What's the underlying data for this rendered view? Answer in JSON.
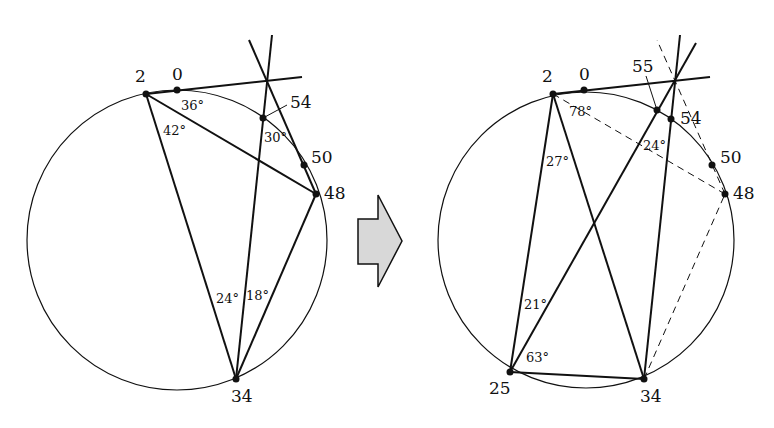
{
  "left_figure": {
    "points": [
      {
        "label": "2"
      },
      {
        "label": "0"
      },
      {
        "label": "54"
      },
      {
        "label": "50"
      },
      {
        "label": "48"
      },
      {
        "label": "34"
      }
    ],
    "angles": [
      {
        "label": "36°"
      },
      {
        "label": "42°"
      },
      {
        "label": "30°"
      },
      {
        "label": "24°"
      },
      {
        "label": "18°"
      }
    ]
  },
  "arrow": {
    "direction": "right",
    "fill": "#d8d8d8"
  },
  "right_figure": {
    "points": [
      {
        "label": "2"
      },
      {
        "label": "0"
      },
      {
        "label": "55"
      },
      {
        "label": "54"
      },
      {
        "label": "50"
      },
      {
        "label": "48"
      },
      {
        "label": "25"
      },
      {
        "label": "34"
      }
    ],
    "angles": [
      {
        "label": "78°"
      },
      {
        "label": "27°"
      },
      {
        "label": "24°"
      },
      {
        "label": "21°"
      },
      {
        "label": "63°"
      }
    ]
  }
}
